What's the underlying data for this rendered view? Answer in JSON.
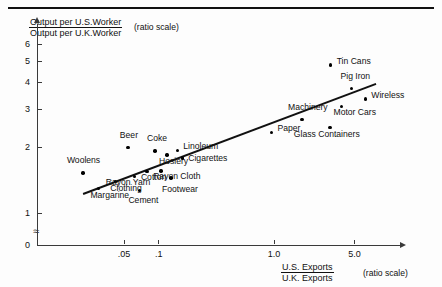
{
  "chart_data": {
    "type": "scatter",
    "title": "",
    "ylabel_numerator": "Output per U.S.Worker",
    "ylabel_denominator": "Output per U.K.Worker",
    "ylabel_note": "(ratio scale)",
    "xlabel_numerator": "U.S. Exports",
    "xlabel_denominator": "U.K. Exports",
    "xlabel_note": "(ratio scale)",
    "xscale": "log",
    "yscale": "log",
    "xticks": [
      ".05",
      ".1",
      "1.0",
      "5.0"
    ],
    "xtick_values": [
      0.05,
      0.1,
      1.0,
      5.0
    ],
    "yticks": [
      "0",
      "1",
      "2",
      "3",
      "4",
      "5",
      "6"
    ],
    "ytick_values": [
      0,
      1,
      2,
      3,
      4,
      5,
      6
    ],
    "xlim": [
      0.018,
      9.0
    ],
    "ylim": [
      1.0,
      6.8
    ],
    "grid": false,
    "legend": "none",
    "points": [
      {
        "label": "Woolens",
        "x": 0.022,
        "y": 1.53
      },
      {
        "label": "Margarine",
        "x": 0.03,
        "y": 1.3
      },
      {
        "label": "Clothing",
        "x": 0.042,
        "y": 1.4
      },
      {
        "label": "Beer",
        "x": 0.054,
        "y": 2.0
      },
      {
        "label": "Rayon Yarn",
        "x": 0.062,
        "y": 1.47
      },
      {
        "label": "Cement",
        "x": 0.068,
        "y": 1.27
      },
      {
        "label": "Cotton",
        "x": 0.079,
        "y": 1.55
      },
      {
        "label": "Coke",
        "x": 0.093,
        "y": 1.93
      },
      {
        "label": "Rayon Cloth",
        "x": 0.105,
        "y": 1.56
      },
      {
        "label": "Hosiery",
        "x": 0.118,
        "y": 1.85
      },
      {
        "label": "Footwear",
        "x": 0.128,
        "y": 1.45
      },
      {
        "label": "Linoleum",
        "x": 0.145,
        "y": 1.94
      },
      {
        "label": "Cigarettes",
        "x": 0.16,
        "y": 1.79
      },
      {
        "label": "Paper",
        "x": 0.95,
        "y": 2.35
      },
      {
        "label": "Machinery",
        "x": 1.75,
        "y": 2.7
      },
      {
        "label": "Glass Containers",
        "x": 3.05,
        "y": 2.48
      },
      {
        "label": "Motor Cars",
        "x": 3.85,
        "y": 3.1
      },
      {
        "label": "Tin Cans",
        "x": 3.1,
        "y": 4.8
      },
      {
        "label": "Pig Iron",
        "x": 4.7,
        "y": 3.75
      },
      {
        "label": "Wireless",
        "x": 6.2,
        "y": 3.35
      }
    ],
    "trendline": {
      "x0": 0.022,
      "y0": 1.23,
      "x1": 7.6,
      "y1": 3.95,
      "style": "solid"
    }
  },
  "axes": {
    "y_title_num": "Output per U.S.Worker",
    "y_title_den": "Output per U.K.Worker",
    "y_note": "(ratio scale)",
    "x_title_num": "U.S. Exports",
    "x_title_den": "U.K. Exports",
    "x_note": "(ratio scale)"
  }
}
